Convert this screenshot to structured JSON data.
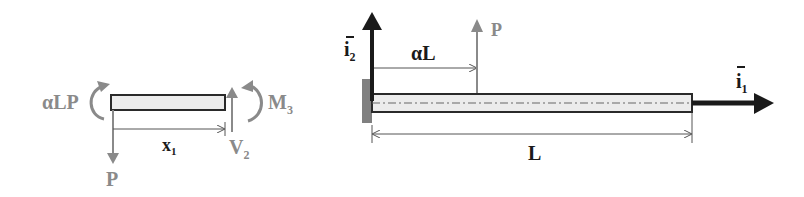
{
  "colors": {
    "dark": "#1a1a1a",
    "gray": "#8a8a8a",
    "beam_fill": "#ececec",
    "support": "#808080"
  },
  "free_body": {
    "moment_left": "αLP",
    "load": "P",
    "position": "x",
    "position_sub": "1",
    "shear": "V",
    "shear_sub": "2",
    "moment_right": "M",
    "moment_right_sub": "3"
  },
  "cantilever": {
    "axis_vertical": "i",
    "axis_vertical_sub": "2",
    "axis_horizontal": "i",
    "axis_horizontal_sub": "1",
    "load_position": "αL",
    "load": "P",
    "length": "L"
  }
}
